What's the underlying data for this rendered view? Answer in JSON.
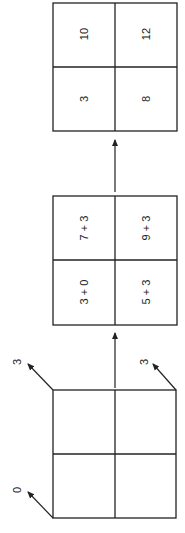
{
  "diagram": {
    "result_grid": {
      "cells": [
        {
          "row": 0,
          "col": 0,
          "value": "10"
        },
        {
          "row": 0,
          "col": 1,
          "value": "12"
        },
        {
          "row": 1,
          "col": 0,
          "value": "3"
        },
        {
          "row": 1,
          "col": 1,
          "value": "8"
        }
      ]
    },
    "sum_grid": {
      "cells": [
        {
          "row": 0,
          "col": 0,
          "value": "7 + 3"
        },
        {
          "row": 0,
          "col": 1,
          "value": "9 + 3"
        },
        {
          "row": 1,
          "col": 0,
          "value": "3 + 0"
        },
        {
          "row": 1,
          "col": 1,
          "value": "5 + 3"
        }
      ]
    },
    "input_grid": {
      "corner_labels": [
        {
          "position": "top-left",
          "value": "3"
        },
        {
          "position": "top-right",
          "value": "3"
        },
        {
          "position": "bottom-left",
          "value": "0"
        }
      ]
    },
    "colors": {
      "line": "#222222",
      "background": "#ffffff"
    }
  }
}
